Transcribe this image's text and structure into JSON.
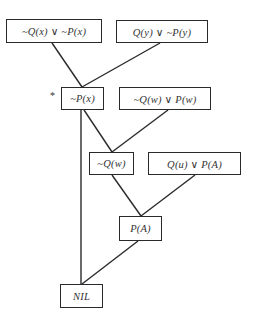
{
  "diagram": {
    "type": "resolution-refutation-tree",
    "nodes": [
      {
        "id": "c1",
        "label": "~Q(x) ∨ ~P(x)",
        "x": 6,
        "y": 19,
        "w": 96,
        "h": 24
      },
      {
        "id": "c2",
        "label": "Q(y) ∨ ~P(y)",
        "x": 116,
        "y": 20,
        "w": 92,
        "h": 23
      },
      {
        "id": "r1",
        "label": "~P(x)",
        "x": 61,
        "y": 87,
        "w": 43,
        "h": 23
      },
      {
        "id": "c3",
        "label": "~Q(w) ∨ P(w)",
        "x": 119,
        "y": 87,
        "w": 92,
        "h": 23
      },
      {
        "id": "r2",
        "label": "~Q(w)",
        "x": 89,
        "y": 152,
        "w": 45,
        "h": 23
      },
      {
        "id": "c4",
        "label": "Q(u) ∨ P(A)",
        "x": 148,
        "y": 152,
        "w": 93,
        "h": 23
      },
      {
        "id": "r3",
        "label": "P(A)",
        "x": 119,
        "y": 216,
        "w": 43,
        "h": 25
      },
      {
        "id": "nil",
        "label": "NIL",
        "x": 60,
        "y": 284,
        "w": 43,
        "h": 24
      }
    ],
    "edges": [
      {
        "from": "c1",
        "to": "r1",
        "x1": 52,
        "y1": 43,
        "x2": 82,
        "y2": 87
      },
      {
        "from": "c2",
        "to": "r1",
        "x1": 160,
        "y1": 43,
        "x2": 82,
        "y2": 87
      },
      {
        "from": "r1",
        "to": "r2",
        "x1": 84,
        "y1": 110,
        "x2": 112,
        "y2": 152
      },
      {
        "from": "c3",
        "to": "r2",
        "x1": 168,
        "y1": 110,
        "x2": 112,
        "y2": 152
      },
      {
        "from": "r2",
        "to": "r3",
        "x1": 112,
        "y1": 175,
        "x2": 141,
        "y2": 216
      },
      {
        "from": "c4",
        "to": "r3",
        "x1": 195,
        "y1": 175,
        "x2": 141,
        "y2": 216
      },
      {
        "from": "r1",
        "to": "nil",
        "x1": 81,
        "y1": 110,
        "x2": 81,
        "y2": 284
      },
      {
        "from": "r3",
        "to": "nil",
        "x1": 138,
        "y1": 241,
        "x2": 82,
        "y2": 284
      }
    ],
    "annotations": [
      {
        "label": "*",
        "x": 50,
        "y": 90,
        "target": "r1"
      }
    ],
    "colors": {
      "stroke": "#2a2a2a",
      "text": "#333333",
      "background": "#ffffff"
    }
  }
}
